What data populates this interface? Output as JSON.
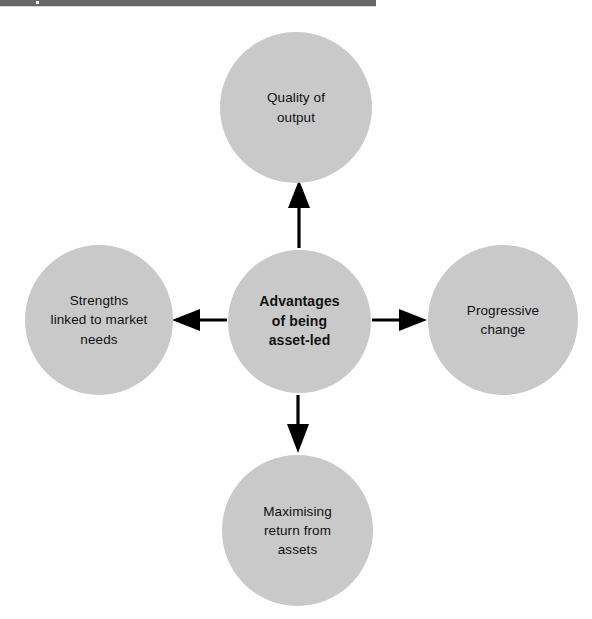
{
  "page": {
    "background_color": "#ffffff",
    "top_bar": {
      "color": "#686868",
      "width_px": 376,
      "height_px": 6
    }
  },
  "diagram": {
    "type": "hub-and-spoke",
    "node_fill_color": "#c9c9c9",
    "arrow_color": "#000000",
    "center": {
      "id": "center",
      "label": "Advantages\nof being\nasset-led",
      "lines": [
        "Advantages",
        "of being",
        "asset-led"
      ],
      "bold": true,
      "shape": "circle",
      "cx": 299,
      "cy": 321,
      "r": 71
    },
    "spokes": [
      {
        "id": "top",
        "label": "Quality of\noutput",
        "lines": [
          "Quality of",
          "output"
        ],
        "direction": "up",
        "arrow": "center-to-node",
        "shape": "circle",
        "cx": 296,
        "cy": 107,
        "r": 76
      },
      {
        "id": "right",
        "label": "Progressive\nchange",
        "lines": [
          "Progressive",
          "change"
        ],
        "direction": "right",
        "arrow": "center-to-node",
        "shape": "circle",
        "cx": 503,
        "cy": 320,
        "r": 75
      },
      {
        "id": "bottom",
        "label": "Maximising\nreturn from\nassets",
        "lines": [
          "Maximising",
          "return from",
          "assets"
        ],
        "direction": "down",
        "arrow": "center-to-node",
        "shape": "circle",
        "cx": 297,
        "cy": 530,
        "r": 75
      },
      {
        "id": "left",
        "label": "Strengths\nlinked to market\nneeds",
        "lines": [
          "Strengths",
          "linked to market",
          "needs"
        ],
        "direction": "left",
        "arrow": "center-to-node",
        "shape": "circle",
        "cx": 99,
        "cy": 320,
        "r": 74
      }
    ]
  }
}
